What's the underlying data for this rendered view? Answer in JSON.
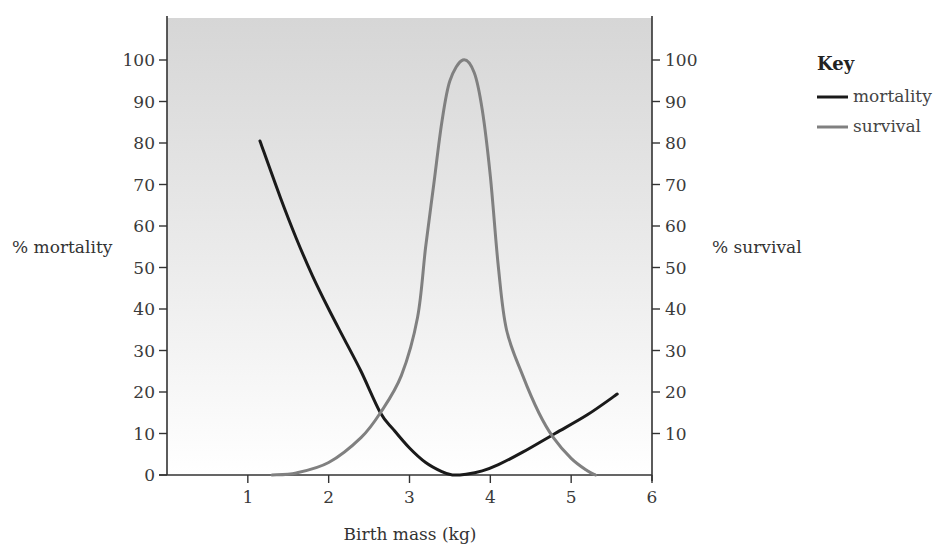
{
  "chart_data": {
    "type": "line",
    "title": "",
    "xlabel": "Birth mass (kg)",
    "ylabel_left": "% mortality",
    "ylabel_right": "% survival",
    "xlim": [
      0,
      6
    ],
    "ylim": [
      0,
      100
    ],
    "x_ticks": [
      1,
      2,
      3,
      4,
      5,
      6
    ],
    "y_ticks_left": [
      0,
      10,
      20,
      30,
      40,
      50,
      60,
      70,
      80,
      90,
      100
    ],
    "y_ticks_right": [
      10,
      20,
      30,
      40,
      50,
      60,
      70,
      80,
      90,
      100
    ],
    "grid": false,
    "legend": {
      "title": "Key",
      "position": "right",
      "entries": [
        "mortality",
        "survival"
      ]
    },
    "series": [
      {
        "name": "mortality",
        "color": "#1a1a1a",
        "axis": "left",
        "points": [
          [
            1.15,
            80.5
          ],
          [
            1.4,
            67
          ],
          [
            1.6,
            57
          ],
          [
            1.8,
            48
          ],
          [
            2.0,
            40
          ],
          [
            2.2,
            32.5
          ],
          [
            2.4,
            25
          ],
          [
            2.64,
            15
          ],
          [
            2.8,
            11
          ],
          [
            3.0,
            6.5
          ],
          [
            3.2,
            3
          ],
          [
            3.4,
            0.8
          ],
          [
            3.53,
            0
          ],
          [
            3.7,
            0.2
          ],
          [
            3.9,
            1
          ],
          [
            4.1,
            2.5
          ],
          [
            4.4,
            5.5
          ],
          [
            4.8,
            10
          ],
          [
            5.2,
            14.5
          ],
          [
            5.57,
            19.5
          ]
        ]
      },
      {
        "name": "survival",
        "color": "#808080",
        "axis": "right",
        "points": [
          [
            1.3,
            0
          ],
          [
            1.6,
            0.5
          ],
          [
            2.0,
            3
          ],
          [
            2.4,
            9
          ],
          [
            2.64,
            15
          ],
          [
            2.9,
            24
          ],
          [
            3.1,
            38
          ],
          [
            3.2,
            55
          ],
          [
            3.3,
            70
          ],
          [
            3.4,
            85
          ],
          [
            3.5,
            95
          ],
          [
            3.66,
            100
          ],
          [
            3.8,
            97
          ],
          [
            3.9,
            88
          ],
          [
            4.0,
            72
          ],
          [
            4.1,
            50
          ],
          [
            4.2,
            35
          ],
          [
            4.4,
            24
          ],
          [
            4.6,
            15
          ],
          [
            4.78,
            9
          ],
          [
            5.0,
            4
          ],
          [
            5.2,
            1
          ],
          [
            5.3,
            0
          ]
        ]
      }
    ]
  },
  "key": {
    "title": "Key",
    "items": [
      {
        "label": "mortality",
        "color": "#1a1a1a"
      },
      {
        "label": "survival",
        "color": "#808080"
      }
    ]
  },
  "axes": {
    "x_title": "Birth mass (kg)",
    "left_title": "% mortality",
    "right_title": "% survival"
  }
}
